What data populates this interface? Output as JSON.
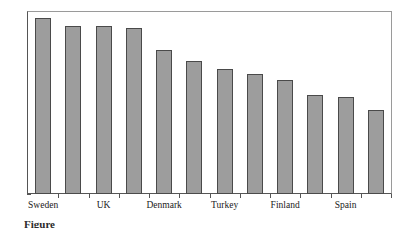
{
  "chart_data": {
    "type": "bar",
    "title": "",
    "subtitle": "",
    "xlabel": "",
    "ylabel": "",
    "ylim": [
      0,
      100
    ],
    "yticks": [
      0,
      10,
      20,
      30,
      40,
      50,
      60,
      70,
      80,
      90,
      100
    ],
    "ytick_labels": [
      "0",
      "10",
      "20",
      "30",
      "40",
      "50",
      "60",
      "70",
      "80",
      "90",
      "100"
    ],
    "grid": false,
    "legend": false,
    "legend_position": "none",
    "bar_color": "#9d9d9d",
    "bar_edge_color": "#4a4a4a",
    "axis_color": "#555555",
    "frame_color": "#9a9a9a",
    "categories": [
      "Sweden",
      "",
      "UK",
      "",
      "Denmark",
      "",
      "Turkey",
      "",
      "Finland",
      "",
      "Spain",
      ""
    ],
    "visible_tick_labels": [
      "Sweden",
      "UK",
      "Denmark",
      "Turkey",
      "Finland",
      "Spain"
    ],
    "values": [
      96,
      92,
      92,
      90.5,
      78.5,
      72.5,
      68.5,
      65.5,
      62.5,
      54,
      53,
      46
    ],
    "bars": [
      {
        "label": "Sweden",
        "value": 96,
        "label_shown": true
      },
      {
        "label": "",
        "value": 92,
        "label_shown": false
      },
      {
        "label": "UK",
        "value": 92,
        "label_shown": true
      },
      {
        "label": "",
        "value": 90.5,
        "label_shown": false
      },
      {
        "label": "Denmark",
        "value": 78.5,
        "label_shown": true
      },
      {
        "label": "",
        "value": 72.5,
        "label_shown": false
      },
      {
        "label": "Turkey",
        "value": 68.5,
        "label_shown": true
      },
      {
        "label": "",
        "value": 65.5,
        "label_shown": false
      },
      {
        "label": "Finland",
        "value": 62.5,
        "label_shown": true
      },
      {
        "label": "",
        "value": 54,
        "label_shown": false
      },
      {
        "label": "Spain",
        "value": 53,
        "label_shown": true
      },
      {
        "label": "",
        "value": 46,
        "label_shown": false
      }
    ]
  },
  "caption": {
    "prefix": "Figure",
    "text": "Figure"
  }
}
